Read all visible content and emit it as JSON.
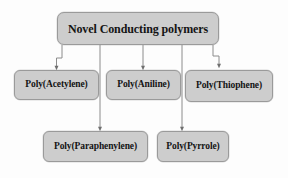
{
  "diagram": {
    "title": "Novel Conducting polymers",
    "type": "tree-flowchart",
    "background_color": "#fdfdfd",
    "node_fill_color": "#cdcdcd",
    "node_border_color": "#9a9a9a",
    "text_color": "#141414",
    "edge_color": "#8c8c8c",
    "root": {
      "id": "root",
      "label": "Novel Conducting polymers"
    },
    "children": [
      {
        "id": "acetylene",
        "label": "Poly(Acetylene)"
      },
      {
        "id": "aniline",
        "label": "Poly(Aniline)"
      },
      {
        "id": "thiophene",
        "label": "Poly(Thiophene)"
      },
      {
        "id": "paraphenylene",
        "label": "Poly(Paraphenylene)"
      },
      {
        "id": "pyrrole",
        "label": "Poly(Pyrrole)"
      }
    ],
    "edges": [
      {
        "from": "root",
        "to": "acetylene"
      },
      {
        "from": "root",
        "to": "aniline"
      },
      {
        "from": "root",
        "to": "thiophene"
      },
      {
        "from": "root",
        "to": "paraphenylene"
      },
      {
        "from": "root",
        "to": "pyrrole"
      }
    ]
  }
}
